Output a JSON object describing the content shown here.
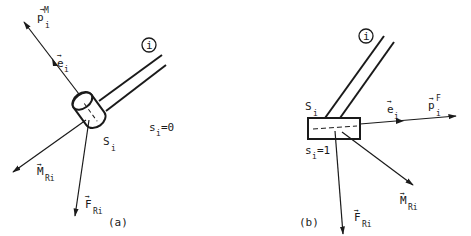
{
  "figure": {
    "type": "free-body diagram",
    "colors": {
      "ink": "#1a1a1a",
      "background": "#ffffff"
    },
    "panel_a": {
      "caption": "(a)",
      "member_label": "i",
      "section_label": {
        "base": "S",
        "sub": "i"
      },
      "position_label": {
        "base": "s",
        "sub": "i",
        "rest": "=0"
      },
      "axis_vector": {
        "base": "e",
        "sub": "i",
        "arrow": "→"
      },
      "load_vector": {
        "base": "p",
        "sup": "M",
        "sub": "i",
        "arrow": "→"
      },
      "moment_vector": {
        "base": "M",
        "sub": "Ri",
        "arrow": "→"
      },
      "force_vector": {
        "base": "F",
        "sub": "Ri",
        "arrow": "→"
      }
    },
    "panel_b": {
      "caption": "(b)",
      "member_label": "i",
      "section_label": {
        "base": "S",
        "sub": "i"
      },
      "position_label": {
        "base": "s",
        "sub": "i",
        "rest": "=1"
      },
      "axis_vector": {
        "base": "e",
        "sub": "i",
        "arrow": "→"
      },
      "load_vector": {
        "base": "p",
        "sup": "F",
        "sub": "i",
        "arrow": "→"
      },
      "moment_vector": {
        "base": "M",
        "sub": "Ri",
        "arrow": "→"
      },
      "force_vector": {
        "base": "F",
        "sub": "Ri",
        "arrow": "→"
      }
    }
  }
}
